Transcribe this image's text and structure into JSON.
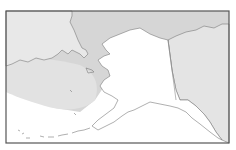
{
  "map": {
    "subject": "Alaska locator map",
    "regions": [
      {
        "name": "Alaska",
        "role": "highlighted"
      },
      {
        "name": "Russia (Chukotka)",
        "role": "neighbor"
      },
      {
        "name": "Canada (Yukon / British Columbia)",
        "role": "neighbor"
      },
      {
        "name": "Arctic Ocean / Bering Sea shaded area",
        "role": "sea-shading"
      },
      {
        "name": "Pacific Ocean",
        "role": "open-water"
      }
    ],
    "colors": {
      "frame": "#555555",
      "alaska_land": "#ffffff",
      "neighbor_land": "#e6e6e6",
      "shaded_sea": "#d4d4d4",
      "inner_shaded_sea": "#e0e0e0",
      "open_water": "#ffffff",
      "coastline": "#7a7a7a",
      "border_line": "#8a8a8a"
    }
  }
}
